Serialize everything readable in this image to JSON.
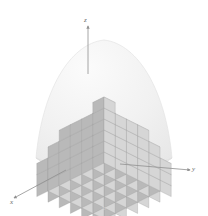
{
  "figure": {
    "background_color": "#ffffff",
    "projection": "isometric",
    "caption": "b"
  },
  "axes": {
    "z": {
      "label": "z",
      "direction": "up",
      "arrow": "arrowhead-up",
      "color": "#8f8f8f"
    },
    "y": {
      "label": "y",
      "direction": "right-down",
      "arrow": "arrowhead-right",
      "color": "#8f8f8f"
    },
    "x": {
      "label": "x",
      "direction": "left-down",
      "arrow": "arrowhead-left",
      "color": "#8f8f8f"
    }
  },
  "solid": {
    "name": "octant-of-sphere",
    "silhouette_fill": "#f2f2f2",
    "silhouette_stroke": "#e2e2e2",
    "base_fill": "#ececec"
  },
  "palette": {
    "box_top": "#ebebeb",
    "box_left": "#b9b9b9",
    "box_right": "#d6d6d6",
    "box_edge": "#9a9a9a",
    "axis": "#8f8f8f",
    "label": "#6a6a6a"
  },
  "chart_data": {
    "type": "surface",
    "xlabel": "x",
    "ylabel": "y",
    "zlabel": "z",
    "grid_nx": 6,
    "grid_ny": 6,
    "radius": 6,
    "column_heights": [
      [
        6,
        5,
        5,
        5,
        4,
        3
      ],
      [
        5,
        5,
        5,
        4,
        4,
        3
      ],
      [
        5,
        5,
        4,
        4,
        3,
        2
      ],
      [
        5,
        4,
        4,
        3,
        3,
        2
      ],
      [
        4,
        4,
        3,
        3,
        2,
        1
      ],
      [
        3,
        3,
        2,
        2,
        1,
        1
      ]
    ]
  }
}
